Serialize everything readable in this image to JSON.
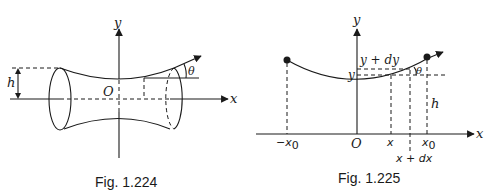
{
  "fig1": {
    "caption": "Fig. 1.224",
    "axis_x": "x",
    "axis_y": "y",
    "origin": "O",
    "height_label": "h",
    "angle_label": "θ"
  },
  "fig2": {
    "caption": "Fig. 1.225",
    "axis_x": "x",
    "axis_y": "y",
    "origin": "O",
    "height_label": "h",
    "angle_label": "θ",
    "label_y": "y",
    "label_y_dy": "y + dy",
    "label_neg_x0": "−x",
    "label_neg_x0_sub": "0",
    "label_x": "x",
    "label_x_dx": "x + dx",
    "label_x0": "x",
    "label_x0_sub": "0"
  }
}
